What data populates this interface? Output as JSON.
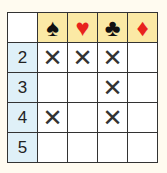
{
  "columns": [
    {
      "suit": "spade",
      "glyph": "♠",
      "color": "#111111"
    },
    {
      "suit": "heart",
      "glyph": "♥",
      "color": "#e8231c"
    },
    {
      "suit": "club",
      "glyph": "♣",
      "color": "#111111"
    },
    {
      "suit": "diamond",
      "glyph": "♦",
      "color": "#e8231c"
    }
  ],
  "rows": [
    {
      "label": "2",
      "cells": [
        "✕",
        "✕",
        "✕",
        ""
      ]
    },
    {
      "label": "3",
      "cells": [
        "",
        "",
        "✕",
        ""
      ]
    },
    {
      "label": "4",
      "cells": [
        "✕",
        "",
        "✕",
        ""
      ]
    },
    {
      "label": "5",
      "cells": [
        "",
        "",
        "",
        ""
      ]
    }
  ],
  "colors": {
    "header_bg": "#fbe9a5",
    "row_label_bg": "#dff0f8",
    "grid_line": "#333333"
  }
}
